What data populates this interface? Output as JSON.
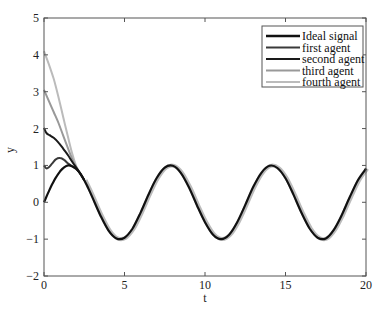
{
  "chart_data": {
    "type": "line",
    "title": "",
    "xlabel": "t",
    "ylabel": "y",
    "xlim": [
      0,
      20
    ],
    "ylim": [
      -2,
      5
    ],
    "xticks": [
      0,
      5,
      10,
      15,
      20
    ],
    "yticks": [
      -2,
      -1,
      0,
      1,
      2,
      3,
      4,
      5
    ],
    "grid": false,
    "legend_position": "upper right",
    "series": [
      {
        "name": "Ideal signal",
        "color": "#111111",
        "width": 2.2,
        "x": [
          0,
          0.25,
          0.5,
          0.75,
          1,
          1.25,
          1.5,
          1.75,
          2,
          2.25,
          2.5,
          2.75,
          3,
          3.5,
          4,
          4.5,
          5,
          5.5,
          6,
          6.5,
          7,
          7.5,
          8,
          8.5,
          9,
          9.5,
          10,
          10.5,
          11,
          11.5,
          12,
          12.5,
          13,
          13.5,
          14,
          14.5,
          15,
          15.5,
          16,
          16.5,
          17,
          17.5,
          18,
          18.5,
          19,
          19.5,
          20
        ],
        "y": [
          0,
          0.25,
          0.48,
          0.68,
          0.84,
          0.95,
          1.0,
          0.98,
          0.91,
          0.78,
          0.6,
          0.38,
          0.14,
          -0.35,
          -0.76,
          -0.98,
          -0.96,
          -0.71,
          -0.28,
          0.22,
          0.66,
          0.94,
          0.99,
          0.8,
          0.41,
          -0.08,
          -0.54,
          -0.88,
          -1.0,
          -0.88,
          -0.54,
          -0.07,
          0.42,
          0.8,
          0.99,
          0.93,
          0.65,
          0.2,
          -0.29,
          -0.71,
          -0.96,
          -0.98,
          -0.75,
          -0.34,
          0.15,
          0.6,
          0.91
        ]
      },
      {
        "name": "first agent",
        "color": "#3a3a3a",
        "width": 2.0,
        "x": [
          0,
          0.15,
          0.3,
          0.5,
          0.75,
          1,
          1.25,
          1.5,
          1.75,
          2,
          2.25,
          2.5
        ],
        "y": [
          1.0,
          0.92,
          0.95,
          1.05,
          1.17,
          1.2,
          1.15,
          1.05,
          0.97,
          0.9,
          0.78,
          0.6
        ]
      },
      {
        "name": "second agent",
        "color": "#1a1a1a",
        "width": 2.0,
        "x": [
          0,
          0.15,
          0.35,
          0.6,
          0.9,
          1.2,
          1.5,
          1.75,
          2,
          2.25,
          2.5
        ],
        "y": [
          2.02,
          1.88,
          1.82,
          1.75,
          1.62,
          1.45,
          1.27,
          1.1,
          0.94,
          0.78,
          0.6
        ]
      },
      {
        "name": "third agent",
        "color": "#999999",
        "width": 2.0,
        "x": [
          0,
          0.3,
          0.6,
          0.9,
          1.2,
          1.5,
          1.75,
          2,
          2.25,
          2.5
        ],
        "y": [
          3.05,
          2.75,
          2.45,
          2.15,
          1.8,
          1.45,
          1.18,
          0.95,
          0.78,
          0.6
        ]
      },
      {
        "name": "fourth agent",
        "color": "#bbbbbb",
        "width": 2.0,
        "x": [
          0,
          0.3,
          0.6,
          0.9,
          1.2,
          1.5,
          1.75,
          2,
          2.25,
          2.5
        ],
        "y": [
          4.1,
          3.75,
          3.35,
          2.85,
          2.3,
          1.75,
          1.32,
          0.98,
          0.78,
          0.6
        ]
      }
    ]
  },
  "legend": {
    "items": [
      {
        "label": "Ideal signal",
        "color": "#111111"
      },
      {
        "label": "first agent",
        "color": "#3a3a3a"
      },
      {
        "label": "second agent",
        "color": "#1a1a1a"
      },
      {
        "label": "third agent",
        "color": "#999999"
      },
      {
        "label": "fourth agent",
        "color": "#bbbbbb"
      }
    ]
  },
  "axes": {
    "xlabel": "t",
    "ylabel": "y",
    "xtick_labels": [
      "0",
      "5",
      "10",
      "15",
      "20"
    ],
    "ytick_labels": [
      "-2",
      "-1",
      "0",
      "1",
      "2",
      "3",
      "4",
      "5"
    ]
  }
}
